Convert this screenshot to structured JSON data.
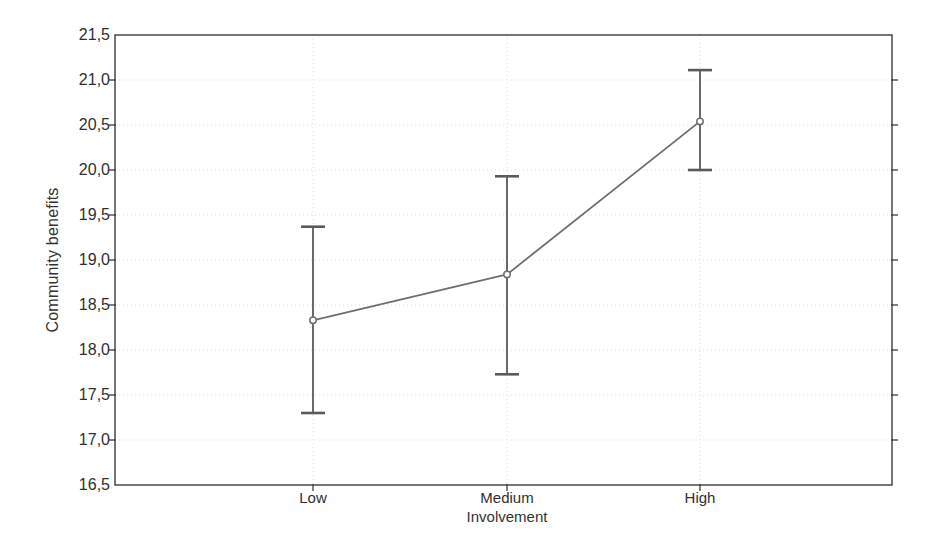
{
  "chart_data": {
    "type": "line",
    "title": "",
    "subtitle": "",
    "xlabel": "Involvement",
    "ylabel": "Community benefits",
    "categories": [
      "Low",
      "Medium",
      "High"
    ],
    "values": [
      18.33,
      18.84,
      20.54
    ],
    "error_upper": [
      19.37,
      19.93,
      21.11
    ],
    "error_lower": [
      17.3,
      17.73,
      20.0
    ],
    "series": [
      {
        "name": "Community benefits",
        "values": [
          18.33,
          18.84,
          20.54
        ],
        "error_upper": [
          19.37,
          19.93,
          21.11
        ],
        "error_lower": [
          17.3,
          17.73,
          20.0
        ]
      }
    ],
    "ylim": [
      16.5,
      21.5
    ],
    "ytick_step": 0.5,
    "ytick_labels": [
      "21,5",
      "21,0",
      "20,5",
      "20,0",
      "19,5",
      "19,0",
      "18,5",
      "18,0",
      "17,5",
      "17,0",
      "16,5"
    ],
    "ytick_values": [
      21.5,
      21.0,
      20.5,
      20.0,
      19.5,
      19.0,
      18.5,
      18.0,
      17.5,
      17.0,
      16.5
    ],
    "decimal_separator": ",",
    "grid": "dotted-light",
    "legend": "none",
    "marker": "open-circle",
    "error_bar_style": "capped-vertical",
    "colors": {
      "line": "#6e6e6e",
      "error_bar": "#5a5a5a",
      "marker_stroke": "#6e6e6e",
      "marker_fill": "#ffffff",
      "frame": "#3c3c3c",
      "grid": "#dedede",
      "text": "#2f2f2f",
      "background": "#ffffff"
    }
  },
  "plot_geometry": {
    "left": 115,
    "right": 892,
    "top": 35,
    "bottom": 485,
    "category_x": [
      313,
      507,
      700
    ]
  }
}
